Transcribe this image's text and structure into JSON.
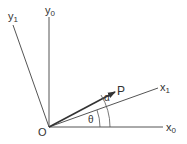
{
  "labels": {
    "y1": "y",
    "y1_sub": "1",
    "y0": "y",
    "y0_sub": "0",
    "x1": "x",
    "x1_sub": "1",
    "x0": "x",
    "x0_sub": "0",
    "origin": "O",
    "point": "P",
    "alpha": "α",
    "theta": "θ"
  }
}
